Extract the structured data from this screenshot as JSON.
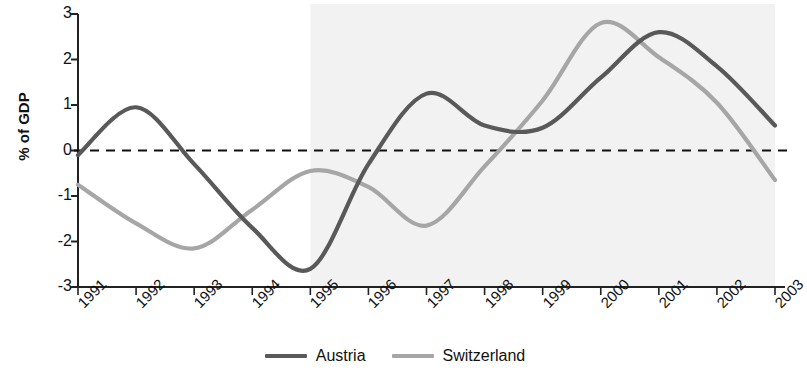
{
  "chart_data": {
    "type": "line",
    "title": "",
    "subtitle": "",
    "xlabel": "",
    "ylabel": "% of GDP",
    "categories": [
      "1991",
      "1992",
      "1993",
      "1994",
      "1995",
      "1996",
      "1997",
      "1998",
      "1999",
      "2000",
      "2001",
      "2002",
      "2003"
    ],
    "x": [
      1991,
      1992,
      1993,
      1994,
      1995,
      1996,
      1997,
      1998,
      1999,
      2000,
      2001,
      2002,
      2003
    ],
    "xlim": [
      1991,
      2003
    ],
    "ylim": [
      -3,
      3
    ],
    "yticks": [
      3,
      2,
      1,
      0,
      -1,
      -2,
      -3
    ],
    "ytick_labels": [
      "3",
      "2",
      "1",
      "0",
      "-1",
      "-2",
      "-3"
    ],
    "grid": false,
    "zero_line": {
      "value": 0,
      "style": "dashed",
      "color": "#111111"
    },
    "shaded_region": {
      "from": "1995",
      "to": "2003",
      "color": "#f2f2f2",
      "label": ""
    },
    "legend_position": "bottom-center",
    "series": [
      {
        "name": "Austria",
        "color": "#595959",
        "values": [
          -0.1,
          0.95,
          -0.3,
          -1.7,
          -2.6,
          -0.3,
          1.25,
          0.55,
          0.5,
          1.6,
          2.6,
          1.85,
          0.55
        ]
      },
      {
        "name": "Switzerland",
        "color": "#a6a6a6",
        "values": [
          -0.75,
          -1.6,
          -2.15,
          -1.3,
          -0.45,
          -0.8,
          -1.65,
          -0.35,
          1.1,
          2.8,
          2.05,
          1.05,
          -0.65
        ]
      }
    ]
  },
  "axes": {
    "y_label": "% of GDP",
    "y_tick_labels": [
      "3",
      "2",
      "1",
      "0",
      "-1",
      "-2",
      "-3"
    ],
    "x_tick_labels": [
      "1991",
      "1992",
      "1993",
      "1994",
      "1995",
      "1996",
      "1997",
      "1998",
      "1999",
      "2000",
      "2001",
      "2002",
      "2003"
    ]
  },
  "legend": {
    "items": [
      {
        "label": "Austria",
        "color": "#595959"
      },
      {
        "label": "Switzerland",
        "color": "#a6a6a6"
      }
    ]
  }
}
